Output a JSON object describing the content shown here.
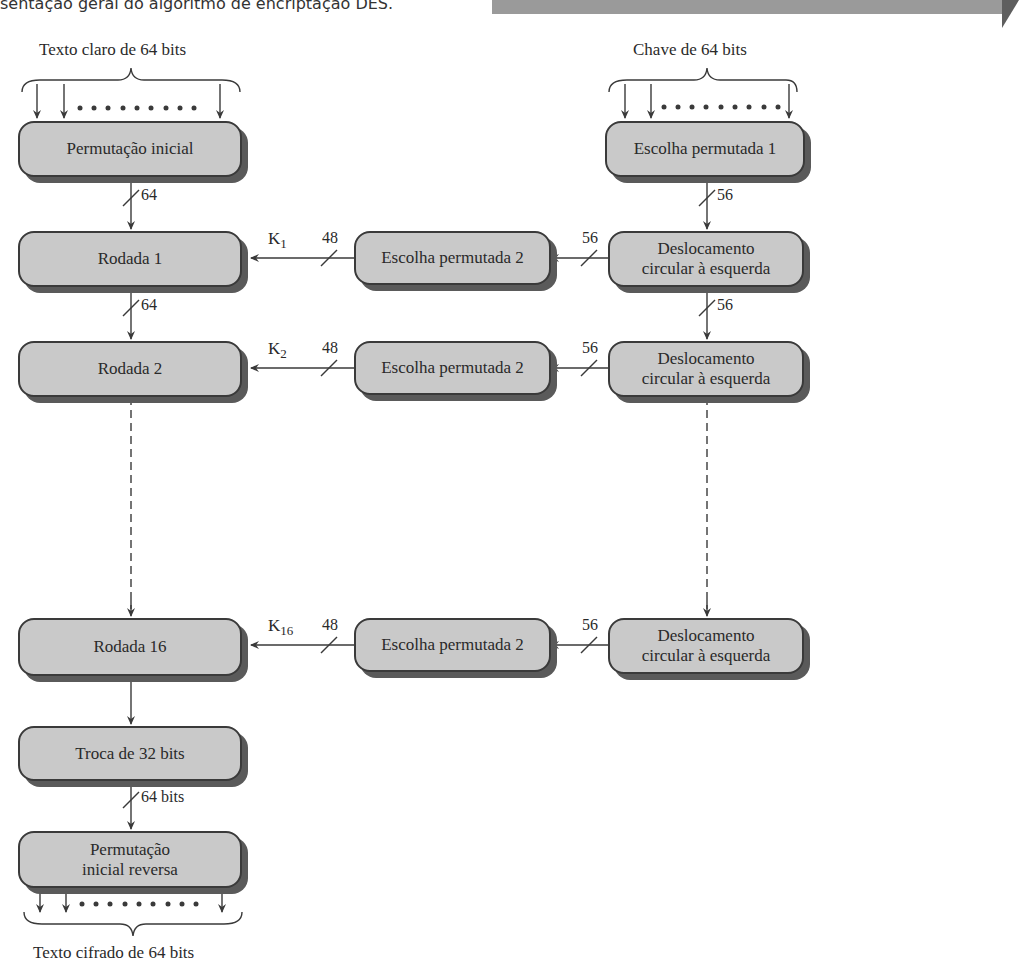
{
  "caption": "sentação geral do algoritmo de encriptação DES.",
  "inputs": {
    "plaintext_label": "Texto claro de 64 bits",
    "key_label": "Chave de 64 bits",
    "ciphertext_label": "Texto cifrado de 64 bits"
  },
  "left_column": {
    "initial_permutation": "Permutação inicial",
    "round1": "Rodada 1",
    "round2": "Rodada 2",
    "round16": "Rodada 16",
    "swap": "Troca de 32 bits",
    "inverse_permutation_line1": "Permutação",
    "inverse_permutation_line2": "inicial reversa"
  },
  "right_column": {
    "pc1": "Escolha permutada 1",
    "shift_line1": "Deslocamento",
    "shift_line2": "circular à esquerda"
  },
  "middle_column": {
    "pc2": "Escolha permutada 2"
  },
  "widths": {
    "w64": "64",
    "w56": "56",
    "w48": "48",
    "w64bits": "64 bits"
  },
  "subkeys": {
    "k": "K",
    "k1": "1",
    "k2": "2",
    "k16": "16"
  },
  "colors": {
    "box_fill": "#c9c9c9",
    "box_border": "#3a3a3a",
    "box_shadow": "#5a5a5a",
    "line": "#3a3a3a"
  }
}
